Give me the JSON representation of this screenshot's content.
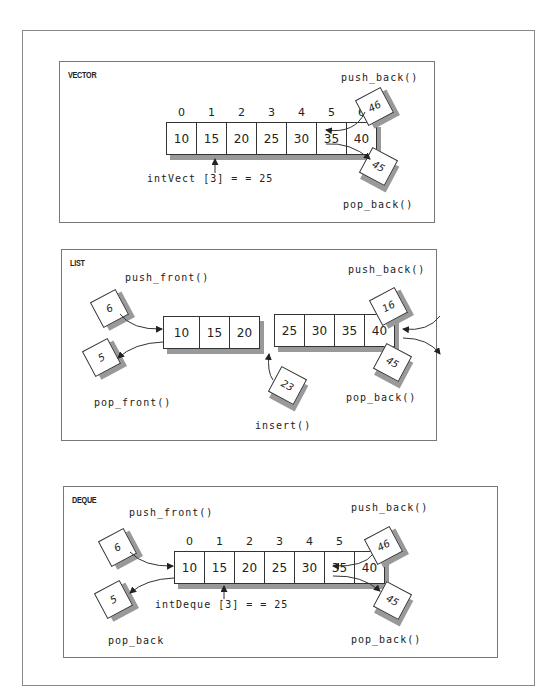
{
  "vector": {
    "title": "VECTOR",
    "indices": [
      "0",
      "1",
      "2",
      "3",
      "4",
      "5",
      "6"
    ],
    "values": [
      "10",
      "15",
      "20",
      "25",
      "30",
      "35",
      "40"
    ],
    "push_back_label": "push_back()",
    "push_back_value": "46",
    "pop_back_label": "pop_back()",
    "pop_back_value": "45",
    "access_label": "intVect [3] = = 25"
  },
  "list": {
    "title": "LIST",
    "left_values": [
      "10",
      "15",
      "20"
    ],
    "right_values": [
      "25",
      "30",
      "35",
      "40"
    ],
    "push_front_label": "push_front()",
    "push_front_value": "6",
    "pop_front_label": "pop_front()",
    "pop_front_value": "5",
    "push_back_label": "push_back()",
    "push_back_value": "16",
    "pop_back_label": "pop_back()",
    "pop_back_value": "45",
    "insert_label": "insert()",
    "insert_value": "23"
  },
  "deque": {
    "title": "DEQUE",
    "indices": [
      "0",
      "1",
      "2",
      "3",
      "4",
      "5",
      "6"
    ],
    "values": [
      "10",
      "15",
      "20",
      "25",
      "30",
      "35",
      "40"
    ],
    "push_front_label": "push_front()",
    "push_front_value": "6",
    "pop_front_label": "pop_back",
    "pop_front_value": "5",
    "push_back_label": "push_back()",
    "push_back_value": "46",
    "pop_back_label": "pop_back()",
    "pop_back_value": "45",
    "access_label": "intDeque [3] = = 25"
  }
}
